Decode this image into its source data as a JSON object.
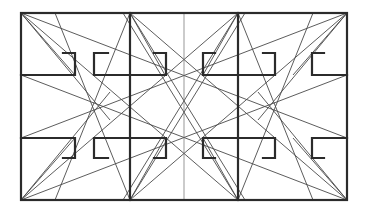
{
  "diagram": {
    "title": "",
    "colors": {
      "stroke": "#2b2b2b",
      "background": "#ffffff"
    },
    "labels": []
  }
}
